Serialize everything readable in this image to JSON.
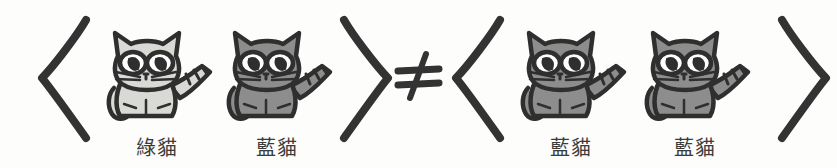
{
  "figure": {
    "background_color": "#fdfdfc",
    "ink_color": "#333333",
    "relation": {
      "symbol": "≠",
      "name": "not-equal-sign",
      "meaning": "not equal"
    },
    "left_group": {
      "open_bracket": "⟨",
      "close_bracket": "⟩",
      "cats": [
        {
          "label": "綠貓",
          "color_name": "green-cat",
          "body_fill": "#d9d9d6",
          "outline": "#2f2f2f"
        },
        {
          "label": "藍貓",
          "color_name": "blue-cat",
          "body_fill": "#8d8d8d",
          "outline": "#2f2f2f"
        }
      ]
    },
    "right_group": {
      "open_bracket": "⟨",
      "close_bracket": "⟩",
      "cats": [
        {
          "label": "藍貓",
          "color_name": "blue-cat",
          "body_fill": "#8d8d8d",
          "outline": "#2f2f2f"
        },
        {
          "label": "藍貓",
          "color_name": "blue-cat",
          "body_fill": "#8d8d8d",
          "outline": "#2f2f2f"
        }
      ]
    }
  }
}
